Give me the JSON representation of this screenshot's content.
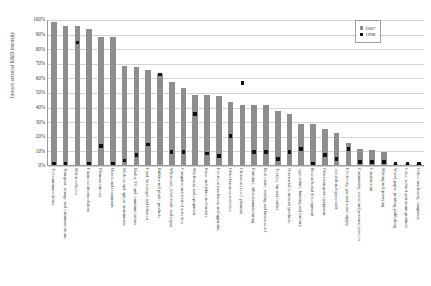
{
  "chart_data": {
    "type": "bar",
    "title": "",
    "xlabel": "",
    "ylabel": "Inward sectoral R&D intensity",
    "ylim": [
      0,
      100
    ],
    "grid": true,
    "legend_position": "top-right",
    "ytick_labels": [
      "100%",
      "90%",
      "80%",
      "70%",
      "60%",
      "50%",
      "40%",
      "30%",
      "20%",
      "10%",
      "0%"
    ],
    "ytick_values": [
      100,
      90,
      80,
      70,
      60,
      50,
      40,
      30,
      20,
      10,
      0
    ],
    "categories": [
      "Telecommunications",
      "Transport, storage and communications",
      "Motor vehicles",
      "Financial intermediation",
      "Pharmaceuticals",
      "Hotels and restaurants",
      "Medical and optical instruments",
      "Radio, TV and communications",
      "Food, beverages and tobacco",
      "Rubber and plastic products",
      "Wholesale, retail trade and repair",
      "Computer and related activities",
      "Machinery and equipment",
      "Basic and fabricated metals",
      "Electrical machinery and apparatus",
      "Other business activities",
      "Chemicals (excl. pharma)",
      "Furniture, other manufacturing",
      "Real estate, renting and business act.",
      "Textiles, fur and leather",
      "Non-metallic mineral products",
      "Agriculture, hunting and forestry",
      "Research and development",
      "Other transport equipment",
      "Aircraft and spacecraft",
      "Electricity, gas and water supply",
      "Community, social and personal services",
      "Construction",
      "Mining and quarrying",
      "Wood, paper, printing, publishing",
      "Coke, refined petroleum products",
      "Office machinery, computers"
    ],
    "series": [
      {
        "name": "2007",
        "color": "#8e8e8e",
        "mark": "bar",
        "values": [
          98,
          95,
          95,
          93,
          88,
          88,
          68,
          67,
          65,
          62,
          57,
          53,
          48,
          48,
          47,
          43,
          41,
          41,
          41,
          37,
          35,
          28,
          28,
          25,
          22,
          15,
          11,
          10,
          9,
          1,
          1,
          1
        ]
      },
      {
        "name": "1998",
        "color": "#111111",
        "mark": "square",
        "values": [
          1,
          1,
          84,
          1,
          13,
          1,
          3,
          7,
          14,
          62,
          9,
          9,
          35,
          8,
          6,
          20,
          56,
          9,
          9,
          4,
          9,
          11,
          1,
          7,
          4,
          11,
          2,
          2,
          2,
          1,
          1,
          1
        ]
      }
    ]
  },
  "legend": {
    "entries": [
      {
        "label": "2007",
        "color": "#8e8e8e"
      },
      {
        "label": "1998",
        "color": "#111111"
      }
    ]
  }
}
